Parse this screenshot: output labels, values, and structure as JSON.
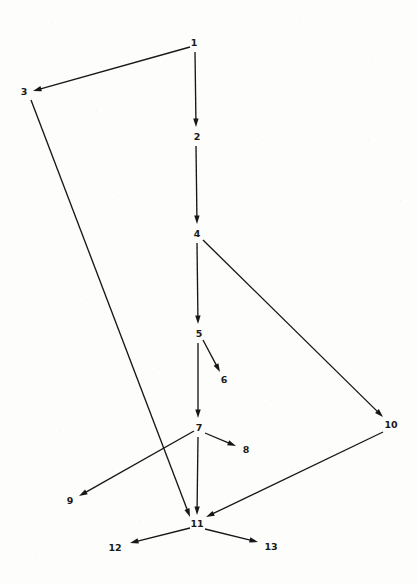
{
  "diagram": {
    "type": "directed-graph",
    "background_color": "#fdfdfb",
    "stroke_color": "#17171a",
    "label_color": "#1a1a1a",
    "nodes": [
      {
        "id": "1",
        "label": "1",
        "x": 194,
        "y": 43
      },
      {
        "id": "2",
        "label": "2",
        "x": 197,
        "y": 137
      },
      {
        "id": "3",
        "label": "3",
        "x": 24,
        "y": 92
      },
      {
        "id": "4",
        "label": "4",
        "x": 197,
        "y": 234
      },
      {
        "id": "5",
        "label": "5",
        "x": 199,
        "y": 334
      },
      {
        "id": "6",
        "label": "6",
        "x": 224,
        "y": 380
      },
      {
        "id": "7",
        "label": "7",
        "x": 199,
        "y": 428
      },
      {
        "id": "8",
        "label": "8",
        "x": 246,
        "y": 450
      },
      {
        "id": "9",
        "label": "9",
        "x": 70,
        "y": 501
      },
      {
        "id": "10",
        "label": "10",
        "x": 391,
        "y": 425
      },
      {
        "id": "11",
        "label": "11",
        "x": 197,
        "y": 524
      },
      {
        "id": "12",
        "label": "12",
        "x": 115,
        "y": 548
      },
      {
        "id": "13",
        "label": "13",
        "x": 271,
        "y": 547
      }
    ],
    "edges": [
      {
        "id": "e1-3",
        "from": "1",
        "to": "3",
        "x1": 190,
        "y1": 47,
        "x2": 33,
        "y2": 91
      },
      {
        "id": "e1-2",
        "from": "1",
        "to": "2",
        "x1": 195,
        "y1": 52,
        "x2": 196,
        "y2": 127
      },
      {
        "id": "e2-4",
        "from": "2",
        "to": "4",
        "x1": 196,
        "y1": 146,
        "x2": 197,
        "y2": 224
      },
      {
        "id": "e3-11",
        "from": "3",
        "to": "11",
        "x1": 31,
        "y1": 100,
        "x2": 190,
        "y2": 517
      },
      {
        "id": "e4-5",
        "from": "4",
        "to": "5",
        "x1": 197,
        "y1": 243,
        "x2": 198,
        "y2": 324
      },
      {
        "id": "e4-10",
        "from": "4",
        "to": "10",
        "x1": 203,
        "y1": 240,
        "x2": 383,
        "y2": 417
      },
      {
        "id": "e5-6",
        "from": "5",
        "to": "6",
        "x1": 203,
        "y1": 340,
        "x2": 220,
        "y2": 372
      },
      {
        "id": "e5-7",
        "from": "5",
        "to": "7",
        "x1": 198,
        "y1": 343,
        "x2": 198,
        "y2": 418
      },
      {
        "id": "e7-8",
        "from": "7",
        "to": "8",
        "x1": 205,
        "y1": 433,
        "x2": 236,
        "y2": 446
      },
      {
        "id": "e7-9",
        "from": "7",
        "to": "9",
        "x1": 194,
        "y1": 431,
        "x2": 79,
        "y2": 496
      },
      {
        "id": "e7-11",
        "from": "7",
        "to": "11",
        "x1": 198,
        "y1": 437,
        "x2": 197,
        "y2": 515
      },
      {
        "id": "e10-11",
        "from": "10",
        "to": "11",
        "x1": 383,
        "y1": 432,
        "x2": 206,
        "y2": 517
      },
      {
        "id": "e11-12",
        "from": "11",
        "to": "12",
        "x1": 190,
        "y1": 528,
        "x2": 130,
        "y2": 543
      },
      {
        "id": "e11-13",
        "from": "11",
        "to": "13",
        "x1": 205,
        "y1": 529,
        "x2": 258,
        "y2": 542
      }
    ]
  }
}
